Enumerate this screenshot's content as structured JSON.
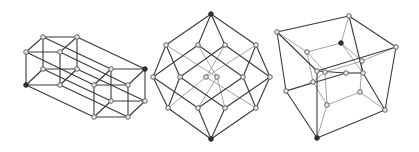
{
  "figures": [
    {
      "id": "prism-projection",
      "label": "Tesseract as two offset cubes (parallel projection)",
      "nodes": [
        [
          43,
          37
        ],
        [
          77,
          37
        ],
        [
          26,
          52
        ],
        [
          60,
          52
        ],
        [
          43,
          69
        ],
        [
          77,
          69
        ],
        [
          26,
          85
        ],
        [
          60,
          85
        ],
        [
          111,
          69
        ],
        [
          145,
          69
        ],
        [
          94,
          85
        ],
        [
          128,
          85
        ],
        [
          111,
          101
        ],
        [
          145,
          101
        ],
        [
          94,
          117
        ],
        [
          128,
          117
        ]
      ],
      "dark_nodes": [
        6,
        9
      ],
      "edges": [
        [
          0,
          1
        ],
        [
          2,
          3
        ],
        [
          4,
          5
        ],
        [
          6,
          7
        ],
        [
          0,
          2
        ],
        [
          1,
          3
        ],
        [
          4,
          6
        ],
        [
          5,
          7
        ],
        [
          0,
          4
        ],
        [
          1,
          5
        ],
        [
          2,
          6
        ],
        [
          3,
          7
        ],
        [
          8,
          9
        ],
        [
          10,
          11
        ],
        [
          12,
          13
        ],
        [
          14,
          15
        ],
        [
          8,
          10
        ],
        [
          9,
          11
        ],
        [
          12,
          14
        ],
        [
          13,
          15
        ],
        [
          8,
          12
        ],
        [
          9,
          13
        ],
        [
          10,
          14
        ],
        [
          11,
          15
        ],
        [
          0,
          8
        ],
        [
          1,
          9
        ],
        [
          2,
          10
        ],
        [
          3,
          11
        ],
        [
          4,
          12
        ],
        [
          5,
          13
        ],
        [
          6,
          14
        ],
        [
          7,
          15
        ]
      ],
      "light_edges": []
    },
    {
      "id": "petrie-projection",
      "label": "Tesseract Petrie polygon projection",
      "nodes": [
        [
          211,
          14
        ],
        [
          166,
          45
        ],
        [
          198,
          45
        ],
        [
          225,
          45
        ],
        [
          256,
          45
        ],
        [
          153,
          77
        ],
        [
          180,
          77
        ],
        [
          206,
          77
        ],
        [
          217,
          77
        ],
        [
          243,
          77
        ],
        [
          270,
          77
        ],
        [
          168,
          108
        ],
        [
          198,
          108
        ],
        [
          225,
          108
        ],
        [
          256,
          108
        ],
        [
          211,
          139
        ]
      ],
      "dark_nodes": [
        0,
        15
      ],
      "edges": [
        [
          0,
          1
        ],
        [
          0,
          2
        ],
        [
          0,
          3
        ],
        [
          0,
          4
        ],
        [
          1,
          5
        ],
        [
          1,
          6
        ],
        [
          2,
          5
        ],
        [
          2,
          9
        ],
        [
          3,
          6
        ],
        [
          3,
          10
        ],
        [
          4,
          9
        ],
        [
          4,
          10
        ],
        [
          5,
          11
        ],
        [
          5,
          12
        ],
        [
          6,
          11
        ],
        [
          6,
          13
        ],
        [
          9,
          12
        ],
        [
          9,
          14
        ],
        [
          10,
          13
        ],
        [
          10,
          14
        ],
        [
          11,
          15
        ],
        [
          12,
          15
        ],
        [
          13,
          15
        ],
        [
          14,
          15
        ]
      ],
      "light_edges": [
        [
          1,
          8
        ],
        [
          2,
          8
        ],
        [
          3,
          7
        ],
        [
          4,
          7
        ],
        [
          7,
          11
        ],
        [
          7,
          14
        ],
        [
          8,
          12
        ],
        [
          8,
          13
        ]
      ]
    },
    {
      "id": "cell-first-projection",
      "label": "Tesseract cube-in-cube perspective projection",
      "nodes": [
        [
          277,
          32
        ],
        [
          349,
          16
        ],
        [
          396,
          47
        ],
        [
          317,
          71
        ],
        [
          286,
          91
        ],
        [
          346,
          73
        ],
        [
          363,
          73
        ],
        [
          385,
          110
        ],
        [
          317,
          138
        ],
        [
          307,
          52
        ],
        [
          341,
          43
        ],
        [
          362,
          61
        ],
        [
          313,
          82
        ],
        [
          325,
          72
        ],
        [
          327,
          105
        ],
        [
          360,
          92
        ]
      ],
      "dark_nodes": [
        8,
        10
      ],
      "edges": [
        [
          0,
          1
        ],
        [
          1,
          2
        ],
        [
          2,
          3
        ],
        [
          3,
          0
        ],
        [
          0,
          4
        ],
        [
          1,
          6
        ],
        [
          2,
          7
        ],
        [
          3,
          8
        ],
        [
          4,
          8
        ],
        [
          8,
          7
        ],
        [
          4,
          5
        ],
        [
          5,
          6
        ],
        [
          6,
          7
        ],
        [
          3,
          5
        ]
      ],
      "light_edges": [
        [
          9,
          10
        ],
        [
          10,
          11
        ],
        [
          11,
          13
        ],
        [
          13,
          9
        ],
        [
          9,
          12
        ],
        [
          12,
          14
        ],
        [
          14,
          15
        ],
        [
          15,
          11
        ],
        [
          10,
          6
        ],
        [
          13,
          14
        ],
        [
          0,
          9
        ],
        [
          1,
          10
        ],
        [
          2,
          11
        ],
        [
          4,
          12
        ],
        [
          8,
          14
        ],
        [
          7,
          15
        ],
        [
          12,
          13
        ]
      ]
    }
  ]
}
